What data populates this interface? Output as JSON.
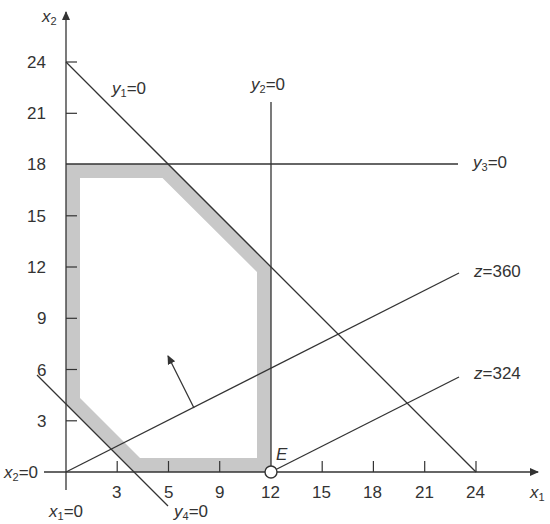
{
  "figure": {
    "axes": {
      "x_label": "x",
      "x_label_sub": "1",
      "y_label": "x",
      "y_label_sub": "2",
      "x_ticks": [
        {
          "value": 3,
          "label": "3"
        },
        {
          "value": 6,
          "label": "5"
        },
        {
          "value": 9,
          "label": "9"
        },
        {
          "value": 12,
          "label": "12"
        },
        {
          "value": 15,
          "label": "15"
        },
        {
          "value": 18,
          "label": "18"
        },
        {
          "value": 21,
          "label": "21"
        },
        {
          "value": 24,
          "label": "24"
        }
      ],
      "y_ticks": [
        {
          "value": 3,
          "label": "3"
        },
        {
          "value": 6,
          "label": "6"
        },
        {
          "value": 9,
          "label": "9"
        },
        {
          "value": 12,
          "label": "12"
        },
        {
          "value": 15,
          "label": "15"
        },
        {
          "value": 18,
          "label": "18"
        },
        {
          "value": 21,
          "label": "21"
        },
        {
          "value": 24,
          "label": "24"
        }
      ]
    },
    "lines": [
      {
        "name": "y1",
        "label_var": "y",
        "label_sub": "1",
        "label_rest": "=0",
        "equation": "x1 + x2 = 24"
      },
      {
        "name": "y2",
        "label_var": "y",
        "label_sub": "2",
        "label_rest": "=0",
        "equation": "x1 = 12"
      },
      {
        "name": "y3",
        "label_var": "y",
        "label_sub": "3",
        "label_rest": "=0",
        "equation": "x2 = 18"
      },
      {
        "name": "y4",
        "label_var": "y",
        "label_sub": "4",
        "label_rest": "=0",
        "equation": "x1 + x2 = 4"
      },
      {
        "name": "x1",
        "label_var": "x",
        "label_sub": "1",
        "label_rest": "=0",
        "equation": "x1 = 0"
      },
      {
        "name": "x2",
        "label_var": "x",
        "label_sub": "2",
        "label_rest": "=0",
        "equation": "x2 = 0"
      },
      {
        "name": "z360",
        "label_var": "z",
        "label_sub": "",
        "label_rest": "=360",
        "equation": "objective z = 360"
      },
      {
        "name": "z324",
        "label_var": "z",
        "label_sub": "",
        "label_rest": "=324",
        "equation": "objective z = 324"
      }
    ],
    "feasible_region": {
      "vertices": [
        [
          0,
          18
        ],
        [
          6,
          18
        ],
        [
          12,
          12
        ],
        [
          12,
          0
        ],
        [
          4,
          0
        ],
        [
          0,
          4
        ]
      ],
      "fill_color": "#c8c8c8"
    },
    "point": {
      "label": "E",
      "x1": 12,
      "x2": 0
    },
    "colors": {
      "line": "#333333",
      "band": "#c8c8c8"
    }
  }
}
